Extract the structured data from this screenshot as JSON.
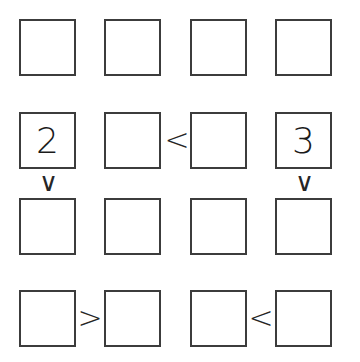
{
  "puzzle": {
    "type": "futoshiki-inequality-grid",
    "rows": 4,
    "columns": 4,
    "background_color": "#ffffff",
    "cell_border_color": "#3c3c3c",
    "glyph_color": "#1a1a1a",
    "cells": [
      [
        {
          "row": 1,
          "col": 1,
          "value": ""
        },
        {
          "row": 1,
          "col": 2,
          "value": ""
        },
        {
          "row": 1,
          "col": 3,
          "value": ""
        },
        {
          "row": 1,
          "col": 4,
          "value": ""
        }
      ],
      [
        {
          "row": 2,
          "col": 1,
          "value": "2"
        },
        {
          "row": 2,
          "col": 2,
          "value": ""
        },
        {
          "row": 2,
          "col": 3,
          "value": ""
        },
        {
          "row": 2,
          "col": 4,
          "value": "3"
        }
      ],
      [
        {
          "row": 3,
          "col": 1,
          "value": ""
        },
        {
          "row": 3,
          "col": 2,
          "value": ""
        },
        {
          "row": 3,
          "col": 3,
          "value": ""
        },
        {
          "row": 3,
          "col": 4,
          "value": ""
        }
      ],
      [
        {
          "row": 4,
          "col": 1,
          "value": ""
        },
        {
          "row": 4,
          "col": 2,
          "value": ""
        },
        {
          "row": 4,
          "col": 3,
          "value": ""
        },
        {
          "row": 4,
          "col": 4,
          "value": ""
        }
      ]
    ],
    "horizontal_constraints": [
      {
        "row": 2,
        "between_cols": [
          2,
          3
        ],
        "symbol": "<"
      },
      {
        "row": 4,
        "between_cols": [
          1,
          2
        ],
        "symbol": ">"
      },
      {
        "row": 4,
        "between_cols": [
          3,
          4
        ],
        "symbol": "<"
      }
    ],
    "vertical_constraints": [
      {
        "col": 1,
        "between_rows": [
          2,
          3
        ],
        "symbol": "∨"
      },
      {
        "col": 4,
        "between_rows": [
          2,
          3
        ],
        "symbol": "∨"
      }
    ]
  }
}
